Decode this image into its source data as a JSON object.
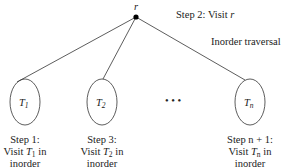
{
  "diagram": {
    "title": "Inorder traversal",
    "root": {
      "label": "r",
      "x": 136,
      "y": 17,
      "step_label": "Step 2: Visit ",
      "step_var": "r"
    },
    "subtrees": [
      {
        "id": "T1",
        "label": "T",
        "subscript": "1",
        "cx": 25,
        "cy": 102,
        "rx": 15,
        "ry": 23,
        "caption": [
          "Step 1:",
          "Visit ",
          "T",
          "1",
          " in",
          "inorder"
        ]
      },
      {
        "id": "T2",
        "label": "T",
        "subscript": "2",
        "cx": 102,
        "cy": 102,
        "rx": 15,
        "ry": 23,
        "caption": [
          "Step 3:",
          "Visit ",
          "T",
          "2",
          " in",
          "inorder"
        ]
      },
      {
        "id": "Tn",
        "label": "T",
        "subscript": "n",
        "cx": 250,
        "cy": 102,
        "rx": 15,
        "ry": 23,
        "caption": [
          "Step n + 1:",
          "Visit ",
          "T",
          "n",
          " in",
          "inorder"
        ]
      }
    ],
    "ellipsis": "• • •",
    "colors": {
      "line": "#333333",
      "text": "#222222",
      "background": "#ffffff"
    }
  }
}
